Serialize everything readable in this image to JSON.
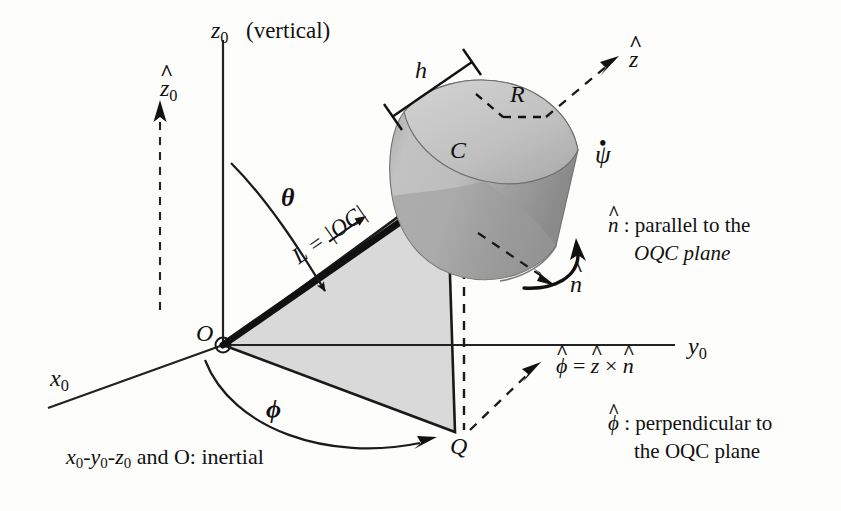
{
  "diagram": {
    "axes": {
      "z0": {
        "label": "z",
        "sub": "0",
        "note": "(vertical)"
      },
      "y0": {
        "label": "y",
        "sub": "0"
      },
      "x0": {
        "label": "x",
        "sub": "0"
      }
    },
    "unit_vectors": {
      "z0_hat": {
        "base": "z",
        "sub": "0",
        "hat": "^"
      },
      "z_hat": {
        "base": "z",
        "hat": "^"
      },
      "n_hat": {
        "base": "n",
        "hat": "^"
      },
      "phi_hat": {
        "base": "ϕ",
        "hat": "^"
      }
    },
    "points": {
      "O": "O",
      "C": "C",
      "Q": "Q"
    },
    "angles": {
      "theta": "θ",
      "phi": "ϕ",
      "psi_dot": "ψ"
    },
    "dimensions": {
      "h": "h",
      "R": "R",
      "L_prefix": "L = |",
      "L_vector": "OC",
      "L_suffix": "|"
    },
    "notes": {
      "n_line1_sym": "n",
      "n_line1_rest": " : parallel to the",
      "n_line2": "OQC plane",
      "phi_def_lhs": "ϕ",
      "phi_def_eq": " = ",
      "phi_def_z": "z",
      "phi_def_cross": " × ",
      "phi_def_n": "n",
      "phi_line1_sym": "ϕ",
      "phi_line1_rest": " : perpendicular to",
      "phi_line2": "the OQC plane",
      "inertial_x": "x",
      "inertial_y": "y",
      "inertial_z": "z",
      "inertial_rest": " and O: inertial"
    },
    "colors": {
      "ink": "#111111",
      "triangle_fill": "#d9d9d9",
      "cyl_side_light": "#b9b9b9",
      "cyl_side_dark": "#8f8f8f",
      "cyl_face": "#c9c9c9"
    }
  }
}
